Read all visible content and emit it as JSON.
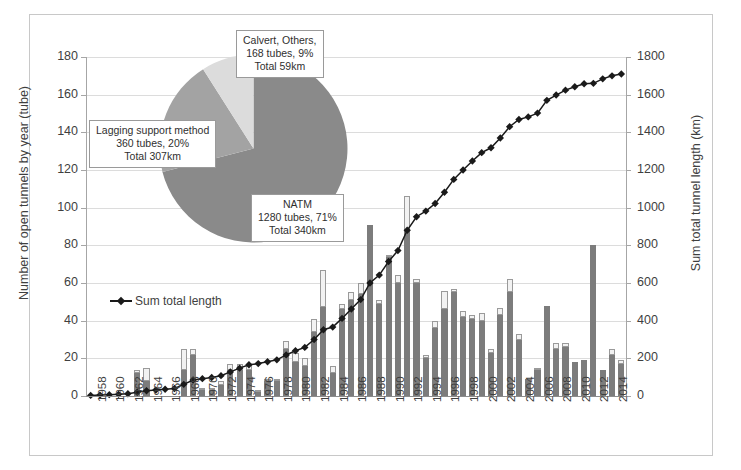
{
  "chart_data": {
    "type": "bar",
    "title": "",
    "xlabel": "",
    "ylabel": "Number of open tunnels by year (tube)",
    "y2label": "Sum total tunnel length (km)",
    "ylim": [
      0,
      180
    ],
    "y2lim": [
      0,
      1800
    ],
    "yticks": [
      0,
      20,
      40,
      60,
      80,
      100,
      120,
      140,
      160,
      180
    ],
    "y2ticks": [
      0,
      200,
      400,
      600,
      800,
      1000,
      1200,
      1400,
      1600,
      1800
    ],
    "grid": true,
    "legend_position": "inside-left",
    "legend": [
      "Sum total length"
    ],
    "categories": [
      "1958",
      "1959",
      "1960",
      "1961",
      "1962",
      "1963",
      "1964",
      "1965",
      "1966",
      "1967",
      "1968",
      "1969",
      "1970",
      "1971",
      "1972",
      "1973",
      "1974",
      "1975",
      "1976",
      "1977",
      "1978",
      "1979",
      "1980",
      "1981",
      "1982",
      "1983",
      "1984",
      "1985",
      "1986",
      "1987",
      "1988",
      "1989",
      "1990",
      "1991",
      "1992",
      "1993",
      "1994",
      "1995",
      "1996",
      "1997",
      "1998",
      "1999",
      "2000",
      "2001",
      "2002",
      "2003",
      "2004",
      "2005",
      "2006",
      "2007",
      "2008",
      "2009",
      "2010",
      "2011",
      "2012",
      "2013",
      "2014",
      "2015"
    ],
    "xtick_labels": [
      "1958",
      "1960",
      "1962",
      "1964",
      "1966",
      "1968",
      "1970",
      "1972",
      "1974",
      "1976",
      "1978",
      "1980",
      "1982",
      "1984",
      "1986",
      "1988",
      "1990",
      "1992",
      "1994",
      "1996",
      "1998",
      "2000",
      "2002",
      "2004",
      "2006",
      "2008",
      "2010",
      "2012",
      "2014"
    ],
    "series": [
      {
        "name": "Open tunnels (lower segment)",
        "color": "#7c7c7c",
        "values": [
          0,
          0,
          0,
          0,
          0,
          12,
          8,
          0,
          0,
          0,
          14,
          22,
          3,
          3,
          6,
          14,
          14,
          14,
          2,
          8,
          8,
          25,
          18,
          16,
          34,
          47,
          12,
          46,
          51,
          54,
          91,
          49,
          74,
          60,
          88,
          60,
          20,
          36,
          46,
          55,
          42,
          41,
          40,
          23,
          43,
          55,
          30,
          9,
          14,
          48,
          25,
          26,
          18,
          19,
          80,
          14,
          22,
          17
        ]
      },
      {
        "name": "Open tunnels (upper segment)",
        "color": "#f2f2f2",
        "values": [
          0,
          0,
          0,
          0,
          0,
          2,
          7,
          0,
          0,
          0,
          11,
          3,
          1,
          1,
          2,
          3,
          3,
          3,
          1,
          1,
          1,
          4,
          5,
          4,
          7,
          20,
          4,
          3,
          4,
          6,
          0,
          2,
          1,
          4,
          18,
          2,
          2,
          4,
          10,
          2,
          3,
          2,
          4,
          2,
          4,
          7,
          3,
          0,
          1,
          0,
          3,
          2,
          0,
          0,
          0,
          0,
          3,
          2
        ]
      }
    ],
    "line_series": {
      "name": "Sum total length",
      "unit": "km",
      "axis": "right",
      "color": "#1a1a1a",
      "values": [
        3,
        5,
        7,
        9,
        12,
        20,
        28,
        32,
        36,
        40,
        62,
        85,
        92,
        98,
        108,
        128,
        148,
        166,
        172,
        182,
        192,
        218,
        240,
        258,
        300,
        352,
        366,
        412,
        462,
        512,
        600,
        642,
        714,
        772,
        880,
        952,
        982,
        1022,
        1082,
        1150,
        1200,
        1248,
        1292,
        1318,
        1370,
        1430,
        1468,
        1482,
        1502,
        1570,
        1598,
        1624,
        1642,
        1658,
        1660,
        1684,
        1700,
        1710
      ]
    },
    "pie_inset": {
      "type": "pie",
      "slices": [
        {
          "name": "NATM",
          "tubes": 1280,
          "percent": 71,
          "total_km": 340,
          "color": "#8a8a8a",
          "label_lines": [
            "NATM",
            "1280 tubes, 71%",
            "Total 340km"
          ]
        },
        {
          "name": "Lagging support method",
          "tubes": 360,
          "percent": 20,
          "total_km": 307,
          "color": "#a3a3a3",
          "label_lines": [
            "Lagging support method",
            "360 tubes, 20%",
            "Total 307km"
          ]
        },
        {
          "name": "Calvert, Others",
          "tubes": 168,
          "percent": 9,
          "total_km": 59,
          "color": "#dcdcdc",
          "label_lines": [
            "Calvert, Others,",
            "168 tubes, 9%",
            "Total 59km"
          ]
        }
      ]
    }
  }
}
